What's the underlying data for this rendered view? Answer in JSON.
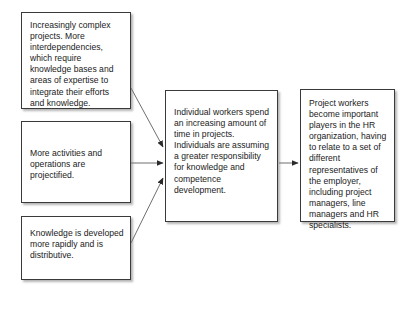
{
  "diagram": {
    "type": "flow-diagram",
    "background_color": "#ffffff",
    "box_border_color": "#3a3a3a",
    "text_color": "#1a1a1a",
    "nodes": [
      {
        "id": "complex-projects",
        "text": "Increasingly complex projects. More interdependencies, which require knowledge bases and areas of expertise to integrate their efforts and knowledge."
      },
      {
        "id": "activities",
        "text": "More activities and operations are projectified."
      },
      {
        "id": "knowledge",
        "text": "Knowledge is developed more rapidly and is distributive."
      },
      {
        "id": "individual-workers",
        "text": "Individual workers spend an increasing amount of time in projects. Individuals are assuming a greater responsibility for knowledge and competence development."
      },
      {
        "id": "project-workers",
        "text": "Project workers become important players in the HR organization, having to relate to a set of different representatives of the employer, including project managers, line managers and HR specialists."
      }
    ],
    "edges": [
      {
        "id": "edge-complex-to-individual",
        "from": "complex-projects",
        "to": "individual-workers",
        "style": "diagonal-arrow"
      },
      {
        "id": "edge-activities-to-individual",
        "from": "activities",
        "to": "individual-workers",
        "style": "horizontal-arrow"
      },
      {
        "id": "edge-knowledge-to-individual",
        "from": "knowledge",
        "to": "individual-workers",
        "style": "diagonal-arrow"
      },
      {
        "id": "edge-individual-to-project",
        "from": "individual-workers",
        "to": "project-workers",
        "style": "horizontal-arrow"
      }
    ]
  }
}
